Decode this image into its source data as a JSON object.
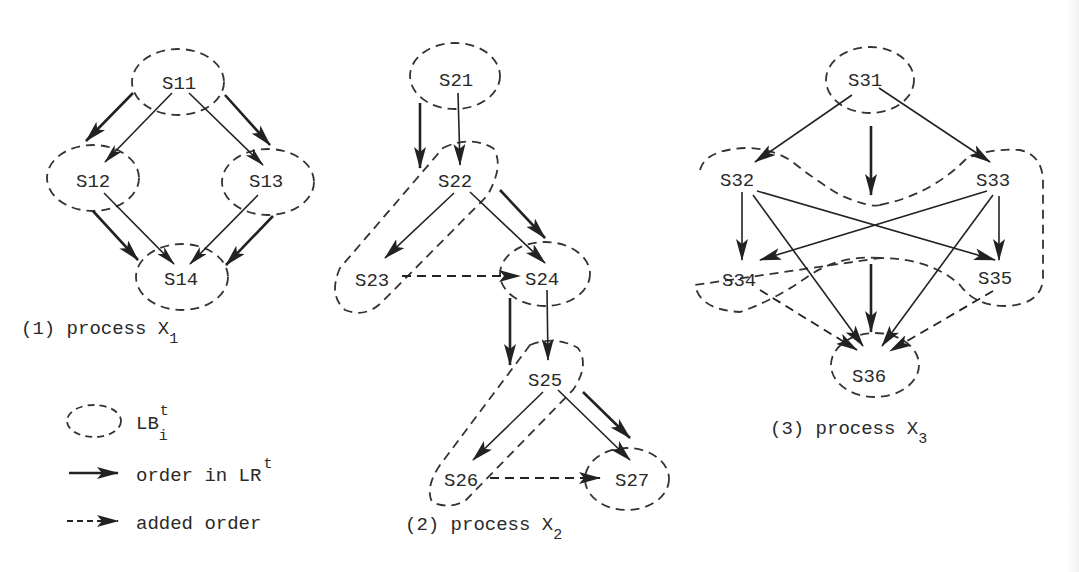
{
  "figure": {
    "processes": [
      {
        "id": "X1",
        "caption_prefix": "(1) process X",
        "caption_sub": "1",
        "nodes": [
          "S11",
          "S12",
          "S13",
          "S14"
        ],
        "edges_lr": [
          [
            "S11",
            "S12"
          ],
          [
            "S11",
            "S13"
          ],
          [
            "S12",
            "S14"
          ],
          [
            "S13",
            "S14"
          ]
        ],
        "edges_added": [],
        "lb_groups": [
          [
            "S11"
          ],
          [
            "S12"
          ],
          [
            "S13"
          ],
          [
            "S14"
          ]
        ]
      },
      {
        "id": "X2",
        "caption_prefix": "(2) process X",
        "caption_sub": "2",
        "nodes": [
          "S21",
          "S22",
          "S23",
          "S24",
          "S25",
          "S26",
          "S27"
        ],
        "edges_lr": [
          [
            "S21",
            "S22"
          ],
          [
            "S22",
            "S23"
          ],
          [
            "S22",
            "S24"
          ],
          [
            "S24",
            "S25"
          ],
          [
            "S25",
            "S26"
          ],
          [
            "S25",
            "S27"
          ]
        ],
        "edges_added": [
          [
            "S23",
            "S24"
          ],
          [
            "S26",
            "S27"
          ]
        ],
        "lb_groups": [
          [
            "S21"
          ],
          [
            "S22",
            "S23"
          ],
          [
            "S24"
          ],
          [
            "S25",
            "S26"
          ],
          [
            "S27"
          ]
        ]
      },
      {
        "id": "X3",
        "caption_prefix": "(3) process X",
        "caption_sub": "3",
        "nodes": [
          "S31",
          "S32",
          "S33",
          "S34",
          "S35",
          "S36"
        ],
        "edges_lr": [
          [
            "S31",
            "S32"
          ],
          [
            "S31",
            "S33"
          ],
          [
            "S32",
            "S34"
          ],
          [
            "S32",
            "S35"
          ],
          [
            "S32",
            "S36"
          ],
          [
            "S33",
            "S34"
          ],
          [
            "S33",
            "S35"
          ],
          [
            "S33",
            "S36"
          ]
        ],
        "edges_added": [
          [
            "S34",
            "S36"
          ],
          [
            "S35",
            "S36"
          ]
        ],
        "lb_groups": [
          [
            "S31"
          ],
          [
            "S32",
            "S34"
          ],
          [
            "S33",
            "S35"
          ],
          [
            "S36"
          ]
        ]
      }
    ],
    "legend": {
      "lb_label": "LB",
      "lb_sup": "t",
      "lb_sub": "i",
      "order_label": "order in LR",
      "order_sup": "t",
      "added_label": "added order"
    }
  }
}
